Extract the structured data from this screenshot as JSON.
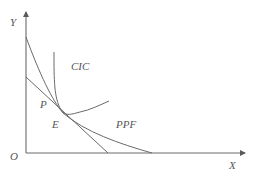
{
  "diagram": {
    "type": "economics-ppf-cic",
    "axes": {
      "y_label": "Y",
      "x_label": "X",
      "origin_label": "O"
    },
    "curves": {
      "cic_label": "CIC",
      "ppf_label": "PPF"
    },
    "points": {
      "p_label": "P",
      "e_label": "E"
    },
    "colors": {
      "line": "#6a6a6a",
      "text": "#555555",
      "background": "#ffffff"
    }
  }
}
